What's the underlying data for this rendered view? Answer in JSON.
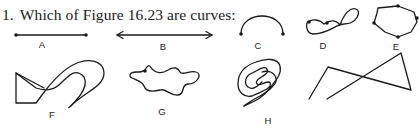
{
  "question": {
    "number": "1.",
    "text": "Which of Figure 16.23 are curves:"
  },
  "figure": {
    "id": "Figure 16.23",
    "items": [
      {
        "label": "A",
        "description": "line segment with two endpoints"
      },
      {
        "label": "B",
        "description": "line with arrows on both ends"
      },
      {
        "label": "C",
        "description": "semicircular arc with two endpoints"
      },
      {
        "label": "D",
        "description": "figure-eight shaped closed curve with two points"
      },
      {
        "label": "E",
        "description": "closed oval-like polygonal curve with four points"
      },
      {
        "label": "F",
        "description": "self-intersecting closed figure with straight and curved parts"
      },
      {
        "label": "G",
        "description": "wavy closed blob curve with one point"
      },
      {
        "label": "H",
        "description": "spiral-like nested closed curve"
      },
      {
        "label": "",
        "description": "self-intersecting open polygonal line (unlabeled)"
      }
    ]
  }
}
